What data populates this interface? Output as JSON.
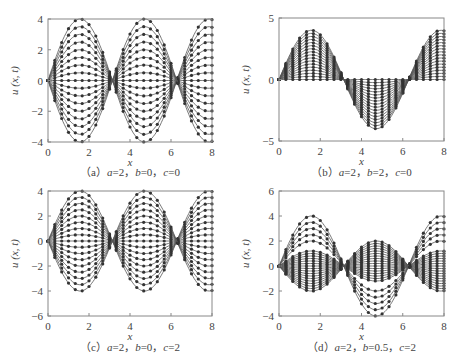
{
  "chart_data": [
    {
      "id": "a",
      "type": "line",
      "title": "",
      "caption": "(a) a=2, b=0, c=0",
      "caption_parts": {
        "tag": "（a）",
        "params": "a=2，b=0，c=0"
      },
      "xlabel": "x",
      "ylabel": "u(x, t)",
      "xlim": [
        0,
        8
      ],
      "ylim": [
        -4,
        4
      ],
      "xticks": [
        0,
        2,
        4,
        6,
        8
      ],
      "yticks": [
        -4,
        -2,
        0,
        2,
        4
      ],
      "grid": false,
      "legend": null,
      "description": "Family of standing-wave curves u = A*sin(x) with amplitudes from -4 to 4 (line + circle markers)",
      "series": {
        "form": "amp*sin(x)",
        "amplitudes": [
          4,
          3.5,
          3,
          2.5,
          2,
          1.5,
          1,
          0.5,
          0,
          -0.5,
          -1,
          -1.5,
          -2,
          -2.5,
          -3,
          -3.5,
          -4
        ]
      }
    },
    {
      "id": "b",
      "type": "line",
      "title": "",
      "caption": "(b) a=2, b=2, c=0",
      "caption_parts": {
        "tag": "（b）",
        "params": "a=2，b=2，c=0"
      },
      "xlabel": "x",
      "ylabel": "u(x, t)",
      "xlim": [
        0,
        8
      ],
      "ylim": [
        -5,
        5
      ],
      "xticks": [
        0,
        2,
        4,
        6,
        8
      ],
      "yticks": [
        -5,
        0,
        5
      ],
      "grid": false,
      "legend": null,
      "description": "Curves u = A*sin(x) with amplitudes 0 to 4 (damped, one-sided)",
      "series": {
        "form": "amp*sin(x)",
        "amplitudes": [
          4,
          3.75,
          3.5,
          3.25,
          3,
          2.75,
          2.5,
          2.25,
          2,
          1.75,
          1.5,
          1.25,
          1,
          0.75,
          0.5,
          0.25,
          0
        ]
      }
    },
    {
      "id": "c",
      "type": "line",
      "title": "",
      "caption": "(c) a=2, b=0, c=2",
      "caption_parts": {
        "tag": "（c）",
        "params": "a=2，b=0，c=2"
      },
      "xlabel": "x",
      "ylabel": "u(x, t)",
      "xlim": [
        0,
        8
      ],
      "ylim": [
        -6,
        4
      ],
      "xticks": [
        0,
        2,
        4,
        6,
        8
      ],
      "yticks": [
        -6,
        -4,
        -2,
        0,
        2,
        4
      ],
      "grid": false,
      "legend": null,
      "description": "Family of curves u = A*sin(x) with amplitudes from -4 to 4",
      "series": {
        "form": "amp*sin(x)",
        "amplitudes": [
          4,
          3.5,
          3,
          2.5,
          2,
          1.5,
          1,
          0.5,
          0,
          -0.5,
          -1,
          -1.5,
          -2,
          -2.5,
          -3,
          -3.5,
          -4
        ]
      }
    },
    {
      "id": "d",
      "type": "line",
      "title": "",
      "caption": "(d) a=2, b=0.5, c=2",
      "caption_parts": {
        "tag": "（d）",
        "params": "a=2，b=0.5，c=2"
      },
      "xlabel": "x",
      "ylabel": "u(x, t)",
      "xlim": [
        0,
        8
      ],
      "ylim": [
        -4,
        6
      ],
      "xticks": [
        0,
        2,
        4,
        6,
        8
      ],
      "yticks": [
        -4,
        -2,
        0,
        2,
        4,
        6
      ],
      "grid": false,
      "legend": null,
      "description": "Curves u = A*sin(x): sparse outer amplitudes up to 4 and a dense band between about -2 and 1.2",
      "series": {
        "form": "amp*sin(x)",
        "amplitudes": [
          4,
          3.5,
          3,
          2.5,
          2,
          1.2,
          1,
          0.8,
          0.6,
          0.4,
          0.2,
          0,
          -0.2,
          -0.4,
          -0.6,
          -0.8,
          -1,
          -1.2,
          -1.4,
          -1.6,
          -1.8,
          -2
        ]
      }
    }
  ],
  "panels": {
    "a": {
      "caption_tag": "（a）",
      "caption_a": "a",
      "caption_a_val": "=2，",
      "caption_b": "b",
      "caption_b_val": "=0，",
      "caption_c": "c",
      "caption_c_val": "=0"
    },
    "b": {
      "caption_tag": "（b）",
      "caption_a": "a",
      "caption_a_val": "=2，",
      "caption_b": "b",
      "caption_b_val": "=2，",
      "caption_c": "c",
      "caption_c_val": "=0"
    },
    "c": {
      "caption_tag": "（c）",
      "caption_a": "a",
      "caption_a_val": "=2，",
      "caption_b": "b",
      "caption_b_val": "=0，",
      "caption_c": "c",
      "caption_c_val": "=2"
    },
    "d": {
      "caption_tag": "（d）",
      "caption_a": "a",
      "caption_a_val": "=2，",
      "caption_b": "b",
      "caption_b_val": "=0.5，",
      "caption_c": "c",
      "caption_c_val": "=2"
    }
  },
  "labels": {
    "xlabel": "x",
    "ylabel": "u (x, t)"
  },
  "colors": {
    "line": "#555555",
    "marker": "#333333",
    "frame": "#888888",
    "text": "#444444"
  }
}
